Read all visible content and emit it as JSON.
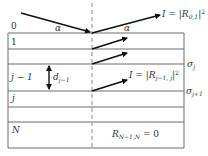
{
  "diagram": {
    "type": "multilayer-reflection-schematic",
    "colors": {
      "line": "#6b6b6b",
      "arrow": "#111111",
      "text": "#333333",
      "dash": "#888888"
    },
    "layers": [
      {
        "label": "0",
        "role": "ambient"
      },
      {
        "label": "1",
        "role": "layer"
      },
      {
        "label": "",
        "role": "layer"
      },
      {
        "label": "j − 1",
        "role": "layer"
      },
      {
        "label": "j",
        "role": "layer"
      },
      {
        "label": "",
        "role": "layer"
      },
      {
        "label": "N",
        "role": "substrate"
      }
    ],
    "angle_label_incident": "α",
    "angle_label_reflected": "α",
    "top_intensity": {
      "lhs": "I = |R",
      "sub": "0,1",
      "rhs": "|",
      "sup": "2"
    },
    "inner_intensity": {
      "lhs": "I = |R",
      "sub": "j−1, j",
      "rhs": "|",
      "sup": "2"
    },
    "thickness_label": {
      "base": "d",
      "sub": "j−1"
    },
    "roughness_labels": [
      {
        "base": "σ",
        "sub": "j"
      },
      {
        "base": "σ",
        "sub": "j+1"
      }
    ],
    "boundary_condition": {
      "base": "R",
      "sub": "N−1,N",
      "rhs": " = 0"
    }
  }
}
